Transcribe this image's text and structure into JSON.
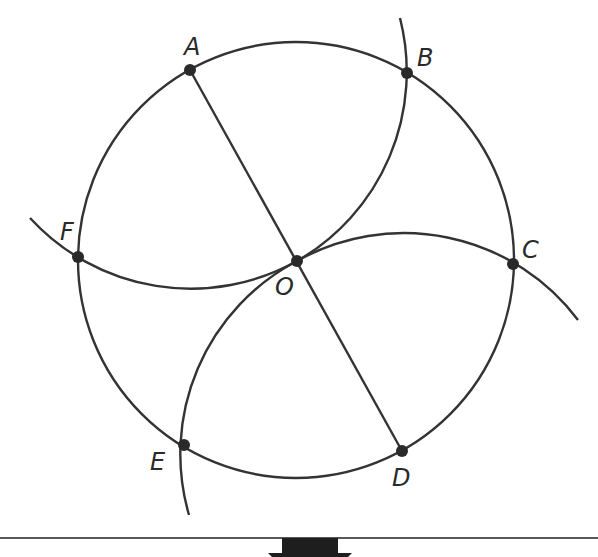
{
  "diagram": {
    "center": {
      "label": "O",
      "x": 297,
      "y": 261
    },
    "radius": 218,
    "points": [
      {
        "label": "A",
        "x": 190,
        "y": 70,
        "lx": 184,
        "ly": 55
      },
      {
        "label": "B",
        "x": 407,
        "y": 73,
        "lx": 417,
        "ly": 66
      },
      {
        "label": "C",
        "x": 513,
        "y": 264,
        "lx": 522,
        "ly": 258
      },
      {
        "label": "D",
        "x": 402,
        "y": 451,
        "lx": 392,
        "ly": 486
      },
      {
        "label": "E",
        "x": 184,
        "y": 445,
        "lx": 150,
        "ly": 470
      },
      {
        "label": "F",
        "x": 78,
        "y": 257,
        "lx": 60,
        "ly": 240
      }
    ],
    "o_label": {
      "text": "O",
      "x": 275,
      "y": 295
    },
    "colors": {
      "line": "#333333",
      "point": "#2a2a2a",
      "bar": "#1e1e1e"
    }
  }
}
